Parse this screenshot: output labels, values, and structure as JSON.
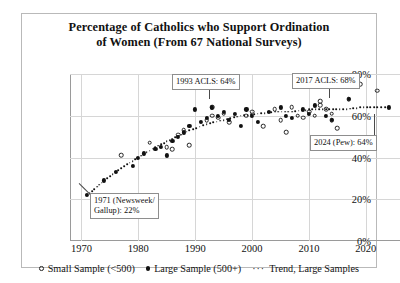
{
  "chart_data": {
    "type": "scatter",
    "title": "Percentage of Catholics who Support Ordination of Women (From 67 National Surveys)",
    "title_line1": "Percentage of Catholics who Support Ordination",
    "title_line2": "of Women (From 67 National Surveys)",
    "xlabel": "",
    "ylabel": "",
    "xlim": [
      1968,
      2026
    ],
    "ylim": [
      0,
      80
    ],
    "xticks": [
      "1970",
      "1980",
      "1990",
      "2000",
      "2010",
      "2020"
    ],
    "xtick_values": [
      1970,
      1980,
      1990,
      2000,
      2010,
      2020
    ],
    "yticks": [
      "0%",
      "20%",
      "40%",
      "60%",
      "80%"
    ],
    "ytick_values": [
      0,
      20,
      40,
      60,
      80
    ],
    "grid": true,
    "legend_position": "bottom",
    "legend": [
      {
        "label": "Small Sample (<500)",
        "marker": "open-circle"
      },
      {
        "label": "Large Sample (500+)",
        "marker": "filled-circle"
      },
      {
        "label": "Trend, Large Samples",
        "marker": "dotted-line"
      }
    ],
    "series": [
      {
        "name": "Small Sample (<500)",
        "marker": "open-circle",
        "points": [
          [
            1977,
            41
          ],
          [
            1982,
            47
          ],
          [
            1985,
            45
          ],
          [
            1986,
            44
          ],
          [
            1987,
            51
          ],
          [
            1988,
            53
          ],
          [
            1989,
            46
          ],
          [
            1992,
            58
          ],
          [
            1993,
            64
          ],
          [
            1993,
            60
          ],
          [
            1994,
            59
          ],
          [
            1995,
            61
          ],
          [
            1996,
            57
          ],
          [
            1999,
            60
          ],
          [
            2000,
            62
          ],
          [
            2002,
            55
          ],
          [
            2004,
            63
          ],
          [
            2005,
            58
          ],
          [
            2006,
            52
          ],
          [
            2007,
            64
          ],
          [
            2008,
            60
          ],
          [
            2009,
            59
          ],
          [
            2010,
            62
          ],
          [
            2011,
            60
          ],
          [
            2012,
            67
          ],
          [
            2012,
            65
          ],
          [
            2013,
            63
          ],
          [
            2014,
            61
          ],
          [
            2014,
            58
          ],
          [
            2015,
            54
          ],
          [
            2017,
            68
          ],
          [
            2019,
            75
          ],
          [
            2022,
            72
          ]
        ]
      },
      {
        "name": "Large Sample (500+)",
        "marker": "filled-circle",
        "points": [
          [
            1971,
            22
          ],
          [
            1974,
            29
          ],
          [
            1976,
            33
          ],
          [
            1979,
            36
          ],
          [
            1980,
            40
          ],
          [
            1981,
            42
          ],
          [
            1983,
            44
          ],
          [
            1984,
            45
          ],
          [
            1985,
            41
          ],
          [
            1986,
            48
          ],
          [
            1987,
            50
          ],
          [
            1988,
            52
          ],
          [
            1989,
            55
          ],
          [
            1990,
            63
          ],
          [
            1991,
            57
          ],
          [
            1992,
            59
          ],
          [
            1993,
            64
          ],
          [
            1994,
            60
          ],
          [
            1995,
            62
          ],
          [
            1996,
            58
          ],
          [
            1997,
            61
          ],
          [
            1998,
            55
          ],
          [
            1999,
            63
          ],
          [
            2000,
            60
          ],
          [
            2001,
            57
          ],
          [
            2003,
            62
          ],
          [
            2005,
            64
          ],
          [
            2006,
            60
          ],
          [
            2007,
            59
          ],
          [
            2009,
            63
          ],
          [
            2010,
            61
          ],
          [
            2011,
            65
          ],
          [
            2013,
            60
          ],
          [
            2014,
            58
          ],
          [
            2017,
            68
          ],
          [
            2024,
            64
          ]
        ]
      }
    ],
    "trend": {
      "name": "Trend, Large Samples",
      "style": "dotted",
      "points": [
        [
          1971,
          22
        ],
        [
          1974,
          29
        ],
        [
          1977,
          35
        ],
        [
          1980,
          40
        ],
        [
          1983,
          45
        ],
        [
          1986,
          49
        ],
        [
          1989,
          53
        ],
        [
          1992,
          56
        ],
        [
          1995,
          58
        ],
        [
          1998,
          60
        ],
        [
          2001,
          61
        ],
        [
          2004,
          62
        ],
        [
          2007,
          62
        ],
        [
          2010,
          63
        ],
        [
          2013,
          63
        ],
        [
          2016,
          63
        ],
        [
          2019,
          64
        ],
        [
          2022,
          64
        ],
        [
          2024,
          64
        ]
      ]
    },
    "annotations": [
      {
        "id": "ann-1971",
        "text": "1971 (Newsweek/\nGallup): 22%",
        "x": 1971,
        "y": 22,
        "box_left": 68,
        "box_top": 179,
        "leader": {
          "x1": 68,
          "y1": 181,
          "x2": 57,
          "y2": 170
        }
      },
      {
        "id": "ann-1993",
        "text": "1993 ACLS: 64%",
        "x": 1993,
        "y": 64,
        "box_left": 150,
        "box_top": 60,
        "leader": {
          "x1": 188,
          "y1": 72,
          "x2": 188,
          "y2": 85
        }
      },
      {
        "id": "ann-2017",
        "text": "2017 ACLS: 68%",
        "x": 2017,
        "y": 68,
        "box_left": 270,
        "box_top": 59,
        "leader": {
          "x1": 308,
          "y1": 71,
          "x2": 308,
          "y2": 84
        }
      },
      {
        "id": "ann-2024",
        "text": "2024 (Pew): 64%",
        "x": 2024,
        "y": 64,
        "box_left": 288,
        "box_top": 121,
        "leader": {
          "x1": 352,
          "y1": 121,
          "x2": 352,
          "y2": 100
        }
      }
    ]
  }
}
